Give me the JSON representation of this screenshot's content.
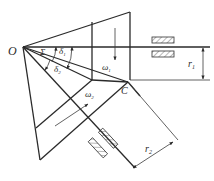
{
  "diagram": {
    "type": "bevel-gear-pair",
    "labels": {
      "apex": "O",
      "pitch_point": "C",
      "shaft_angle": "Σ",
      "delta1": "δ",
      "delta1_sub": "1",
      "delta2": "δ",
      "delta2_sub": "2",
      "omega1": "ω",
      "omega1_sub": "1",
      "omega2": "ω",
      "omega2_sub": "2",
      "r1": "r",
      "r1_sub": "1",
      "r2": "r",
      "r2_sub": "2"
    },
    "colors": {
      "line": "#2a2a2a",
      "background": "#ffffff"
    }
  }
}
